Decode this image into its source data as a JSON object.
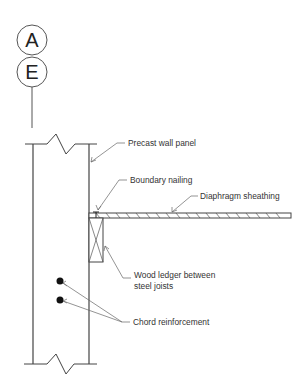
{
  "grid_bubbles": [
    {
      "label": "A"
    },
    {
      "label": "E"
    }
  ],
  "callouts": {
    "precast_wall_panel": "Precast wall panel",
    "boundary_nailing": "Boundary nailing",
    "diaphragm_sheathing": "Diaphragm sheathing",
    "wood_ledger_line1": "Wood ledger between",
    "wood_ledger_line2": "steel joists",
    "chord_reinforcement": "Chord reinforcement"
  },
  "colors": {
    "line": "#444444",
    "text": "#333333",
    "background": "#ffffff"
  }
}
